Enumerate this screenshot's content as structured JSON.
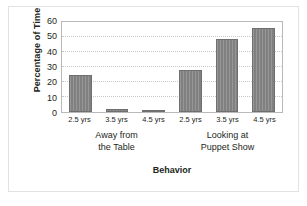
{
  "chart_data": {
    "type": "bar",
    "title": "",
    "xlabel": "Behavior",
    "ylabel": "Percentage of Time",
    "ylim": [
      0,
      60
    ],
    "ytick_values": [
      60,
      50,
      40,
      30,
      20,
      10,
      0
    ],
    "grid": true,
    "legend": "none",
    "categories": [
      "2.5 yrs",
      "3.5 yrs",
      "4.5 yrs",
      "2.5 yrs",
      "3.5 yrs",
      "4.5 yrs"
    ],
    "values": [
      25,
      2,
      1,
      28,
      49,
      56
    ],
    "groups": [
      {
        "label_line1": "Away from",
        "label_line2": "the Table",
        "categories": [
          "2.5 yrs",
          "3.5 yrs",
          "4.5 yrs"
        ],
        "values": [
          25,
          2,
          1
        ]
      },
      {
        "label_line1": "Looking at",
        "label_line2": "Puppet Show",
        "categories": [
          "2.5 yrs",
          "3.5 yrs",
          "4.5 yrs"
        ],
        "values": [
          28,
          49,
          56
        ]
      }
    ],
    "bars": [
      {
        "category": "2.5 yrs",
        "group": "Away from the Table",
        "value": 25
      },
      {
        "category": "3.5 yrs",
        "group": "Away from the Table",
        "value": 2
      },
      {
        "category": "4.5 yrs",
        "group": "Away from the Table",
        "value": 1
      },
      {
        "category": "2.5 yrs",
        "group": "Looking at Puppet Show",
        "value": 28
      },
      {
        "category": "3.5 yrs",
        "group": "Looking at Puppet Show",
        "value": 49
      },
      {
        "category": "4.5 yrs",
        "group": "Looking at Puppet Show",
        "value": 56
      }
    ],
    "colors": {
      "bar_fill": "#808080",
      "bar_edge": "#6f6f6f",
      "plot_border": "#b9b9b9",
      "gridline": "#c9c9c9",
      "text": "#231f20",
      "frame": "#e2e2e2",
      "background": "#ffffff"
    }
  }
}
